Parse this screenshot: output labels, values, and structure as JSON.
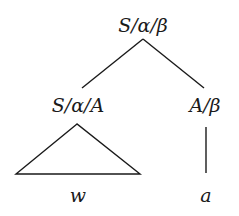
{
  "diagram": {
    "type": "tree",
    "root": {
      "label": "S/α/β",
      "children": [
        {
          "label": "S/α/A",
          "subtree": "triangle",
          "yield": "w"
        },
        {
          "label": "A/β",
          "children": [
            {
              "label": "a"
            }
          ]
        }
      ]
    }
  },
  "labels": {
    "root": "S/α/β",
    "left_child": "S/α/A",
    "right_child": "A/β",
    "left_yield": "w",
    "right_leaf": "a"
  }
}
